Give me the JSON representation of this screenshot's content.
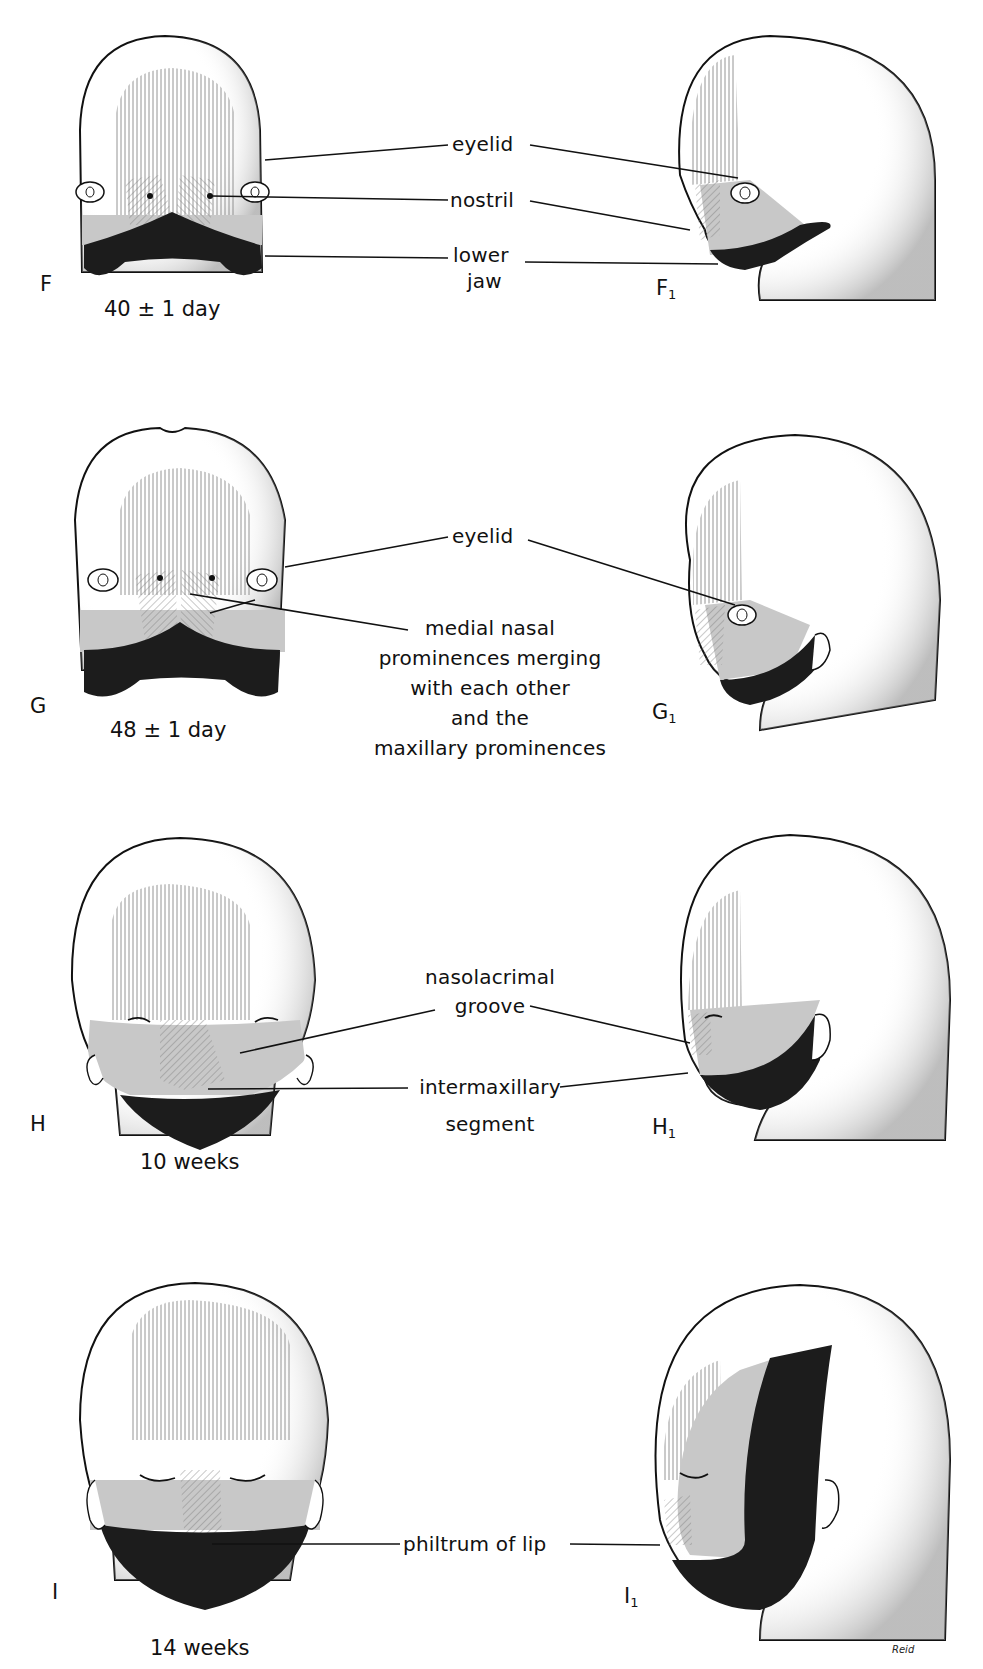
{
  "figure": {
    "rows": [
      {
        "id": "F",
        "frontal_label": "F",
        "lateral_label": "F",
        "lateral_subscript": "1",
        "age": "40 ± 1 day",
        "annotations": [
          "eyelid",
          "nostril",
          "lower",
          "jaw"
        ]
      },
      {
        "id": "G",
        "frontal_label": "G",
        "lateral_label": "G",
        "lateral_subscript": "1",
        "age": "48 ± 1 day",
        "annotations": [
          "eyelid",
          "medial nasal",
          "prominences merging",
          "with each other",
          "and the",
          "maxillary prominences"
        ]
      },
      {
        "id": "H",
        "frontal_label": "H",
        "lateral_label": "H",
        "lateral_subscript": "1",
        "age": "10 weeks",
        "annotations": [
          "nasolacrimal",
          "groove",
          "intermaxillary",
          "segment"
        ]
      },
      {
        "id": "I",
        "frontal_label": "I",
        "lateral_label": "I",
        "lateral_subscript": "1",
        "age": "14 weeks",
        "annotations": [
          "philtrum of lip"
        ]
      }
    ],
    "signature": "Reid",
    "colors": {
      "outline": "#111111",
      "mandibular": "#1c1c1c",
      "maxillary": "#c8c8c8",
      "hatch": "#6a6a6a",
      "background": "#ffffff"
    }
  }
}
